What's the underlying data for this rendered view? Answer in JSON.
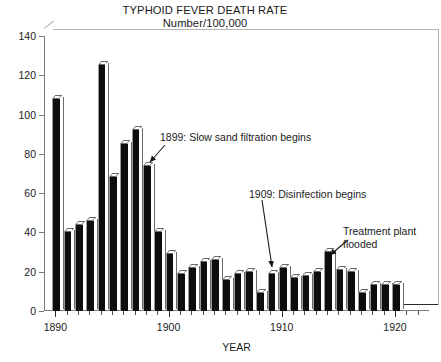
{
  "chart_data": {
    "type": "bar",
    "title": "TYPHOID FEVER DEATH RATE",
    "subtitle": "Number/100,000",
    "xlabel": "YEAR",
    "ylabel": "",
    "ylim": [
      0,
      140
    ],
    "ytick_step": 20,
    "yticks": [
      0,
      20,
      40,
      60,
      80,
      100,
      120,
      140
    ],
    "xlim": [
      1889,
      1923
    ],
    "xticks_major": [
      1890,
      1900,
      1910,
      1920
    ],
    "xticks_minor_step": 1,
    "grid": false,
    "legend": null,
    "categories": [
      1890,
      1891,
      1892,
      1893,
      1894,
      1895,
      1896,
      1897,
      1898,
      1899,
      1900,
      1901,
      1902,
      1903,
      1904,
      1905,
      1906,
      1907,
      1908,
      1909,
      1910,
      1911,
      1912,
      1913,
      1914,
      1915,
      1916,
      1917,
      1918,
      1919,
      1920
    ],
    "values": [
      108,
      40,
      44,
      46,
      125,
      68,
      85,
      92,
      74,
      40,
      29,
      19,
      22,
      25,
      26,
      16,
      19,
      20,
      9,
      19,
      22,
      17,
      18,
      20,
      30,
      21,
      20,
      9,
      13,
      13,
      13
    ],
    "annotations": [
      {
        "text": "1899: Slow sand filtration begins",
        "year": 1899,
        "value": 40
      },
      {
        "text": "1909: Disinfection begins",
        "year": 1909,
        "value": 19
      },
      {
        "text": "Treatment plant flooded",
        "year": 1914,
        "value": 30
      }
    ]
  },
  "ylabels": [
    "0",
    "20",
    "40",
    "60",
    "80",
    "100",
    "120",
    "140"
  ],
  "xlabels": [
    "1890",
    "1900",
    "1910",
    "1920"
  ],
  "axis": {
    "x_title": "YEAR"
  },
  "annotations": {
    "filtration": "1899: Slow sand filtration begins",
    "disinfection": "1909: Disinfection begins",
    "flood_line1": "Treatment plant",
    "flood_line2": "flooded"
  }
}
